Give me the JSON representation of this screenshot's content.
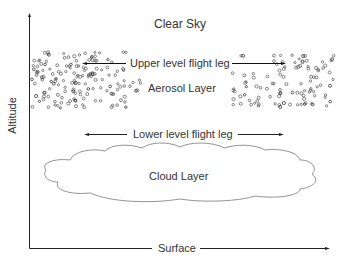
{
  "diagram": {
    "title": "Clear Sky",
    "labels": {
      "clear_sky": "Clear Sky",
      "upper_leg": "Upper level flight leg",
      "aerosol_layer": "Aerosol Layer",
      "lower_leg": "Lower level flight leg",
      "cloud_layer": "Cloud Layer",
      "surface": "Surface",
      "altitude": "Altitude"
    },
    "colors": {
      "line": "#222222",
      "particle": "#555555",
      "cloud_outline": "#777777"
    }
  }
}
